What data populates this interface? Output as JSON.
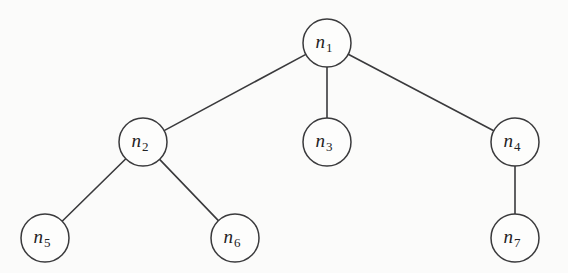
{
  "diagram": {
    "type": "tree",
    "background_color": "#fbfbfa",
    "stroke_color": "#3a3a3c",
    "node_fill_color": "#fdfdfc",
    "label_color": "#232325",
    "node_radius": 24,
    "nodes": [
      {
        "id": "n1",
        "base": "n",
        "subscript": "1",
        "label": "n1",
        "cx": 327,
        "cy": 43
      },
      {
        "id": "n2",
        "base": "n",
        "subscript": "2",
        "label": "n2",
        "cx": 143,
        "cy": 142
      },
      {
        "id": "n3",
        "base": "n",
        "subscript": "3",
        "label": "n3",
        "cx": 327,
        "cy": 142
      },
      {
        "id": "n4",
        "base": "n",
        "subscript": "4",
        "label": "n4",
        "cx": 515,
        "cy": 142
      },
      {
        "id": "n5",
        "base": "n",
        "subscript": "5",
        "label": "n5",
        "cx": 45,
        "cy": 238
      },
      {
        "id": "n6",
        "base": "n",
        "subscript": "6",
        "label": "n6",
        "cx": 235,
        "cy": 238
      },
      {
        "id": "n7",
        "base": "n",
        "subscript": "7",
        "label": "n7",
        "cx": 515,
        "cy": 238
      }
    ],
    "edges": [
      {
        "id": "edge-n1-n2",
        "from": "n1",
        "to": "n2"
      },
      {
        "id": "edge-n1-n3",
        "from": "n1",
        "to": "n3"
      },
      {
        "id": "edge-n1-n4",
        "from": "n1",
        "to": "n4"
      },
      {
        "id": "edge-n2-n5",
        "from": "n2",
        "to": "n5"
      },
      {
        "id": "edge-n2-n6",
        "from": "n2",
        "to": "n6"
      },
      {
        "id": "edge-n4-n7",
        "from": "n4",
        "to": "n7"
      }
    ]
  }
}
